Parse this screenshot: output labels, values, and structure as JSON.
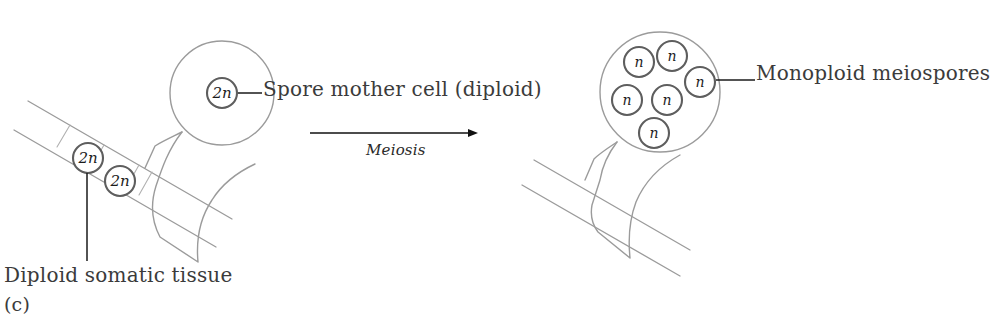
{
  "figure": {
    "panel_caption": "(c)",
    "process_label": "Meiosis",
    "background_color": "#ffffff",
    "outline_color": "#9b9b9b",
    "nucleus_stroke_color": "#5e5e5e",
    "leader_color": "#1a1a1a",
    "text_color": "#3b3b3b"
  },
  "labels": {
    "spore_mother_cell": "Spore mother cell (diploid)",
    "monoploid_meiospores": "Monoploid meiospores",
    "diploid_somatic_tissue": "Diploid somatic tissue"
  },
  "left_structure": {
    "name": "sporangium-before-meiosis",
    "sporangium": {
      "cx": 222,
      "cy": 93,
      "r": 52
    },
    "nuclei": [
      {
        "id": "spore-mother-nucleus",
        "label": "2n",
        "cx": 222,
        "cy": 93,
        "r": 15
      }
    ],
    "tissue_nuclei": [
      {
        "id": "somatic-nucleus-1",
        "label": "2n",
        "cx": 88,
        "cy": 158,
        "r": 15
      },
      {
        "id": "somatic-nucleus-2",
        "label": "2n",
        "cx": 120,
        "cy": 181,
        "r": 15
      }
    ]
  },
  "right_structure": {
    "name": "sporangium-after-meiosis",
    "sporangium": {
      "cx": 660,
      "cy": 92,
      "r": 60
    },
    "nuclei": [
      {
        "id": "meiospore-1",
        "label": "n",
        "cx": 639,
        "cy": 62,
        "r": 15
      },
      {
        "id": "meiospore-2",
        "label": "n",
        "cx": 672,
        "cy": 56,
        "r": 15
      },
      {
        "id": "meiospore-3",
        "label": "n",
        "cx": 700,
        "cy": 82,
        "r": 15
      },
      {
        "id": "meiospore-4",
        "label": "n",
        "cx": 627,
        "cy": 100,
        "r": 15
      },
      {
        "id": "meiospore-5",
        "label": "n",
        "cx": 667,
        "cy": 100,
        "r": 15
      },
      {
        "id": "meiospore-6",
        "label": "n",
        "cx": 654,
        "cy": 133,
        "r": 15
      }
    ],
    "spore_count": 6
  },
  "arrow": {
    "x_start": 310,
    "x_end": 478,
    "y": 133,
    "direction": "left-to-right"
  }
}
